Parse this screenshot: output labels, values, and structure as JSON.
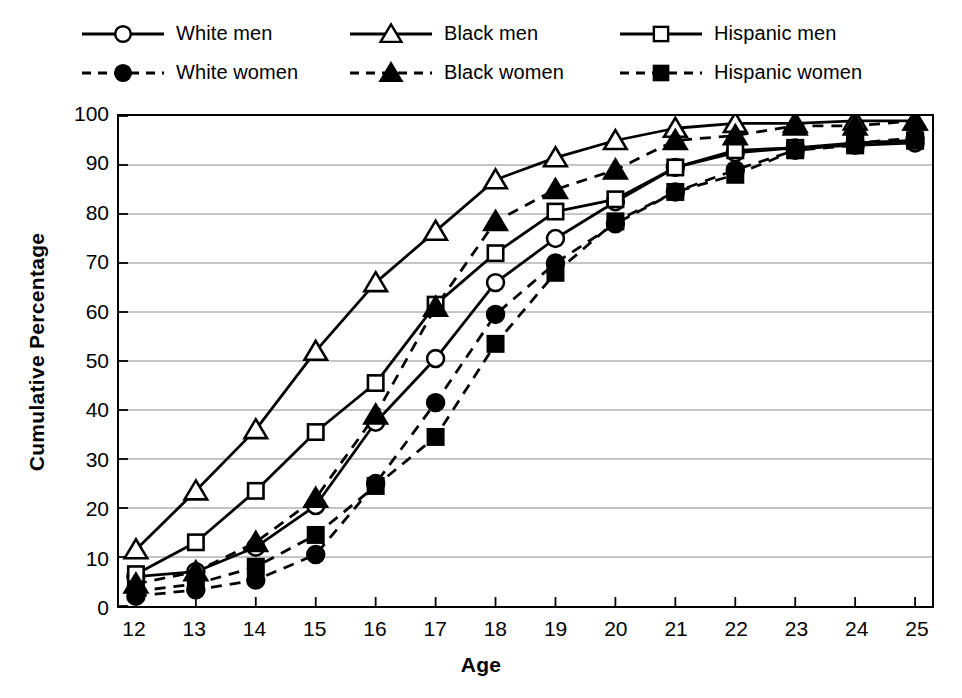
{
  "chart_data": {
    "type": "line",
    "title": "",
    "subtitle": "",
    "xlabel": "Age",
    "ylabel": "Cumulative Percentage",
    "x": [
      12,
      13,
      14,
      15,
      16,
      17,
      18,
      19,
      20,
      21,
      22,
      23,
      24,
      25
    ],
    "xlim": [
      12,
      25
    ],
    "ylim": [
      0,
      100
    ],
    "xticks": [
      "12",
      "13",
      "14",
      "15",
      "16",
      "17",
      "18",
      "19",
      "20",
      "21",
      "22",
      "23",
      "24",
      "25"
    ],
    "yticks": [
      "0",
      "10",
      "20",
      "30",
      "40",
      "50",
      "60",
      "70",
      "80",
      "90",
      "100"
    ],
    "grid": "horizontal",
    "legend_position": "top",
    "series": [
      {
        "name": "White men",
        "marker": "circle-open",
        "line": "solid",
        "color": "#000000",
        "values": [
          6.0,
          7.0,
          12.0,
          20.5,
          37.5,
          50.5,
          66.0,
          75.0,
          82.5,
          89.5,
          92.5,
          93.5,
          94.0,
          94.5
        ]
      },
      {
        "name": "Black men",
        "marker": "triangle-open",
        "line": "solid",
        "color": "#000000",
        "values": [
          11.5,
          23.5,
          36.0,
          52.0,
          66.0,
          76.5,
          87.0,
          91.5,
          95.0,
          97.5,
          98.5,
          98.5,
          99.0,
          99.0
        ]
      },
      {
        "name": "Hispanic men",
        "marker": "square-open",
        "line": "solid",
        "color": "#000000",
        "values": [
          6.5,
          13.0,
          23.5,
          35.5,
          45.5,
          61.5,
          72.0,
          80.5,
          83.0,
          89.5,
          93.0,
          93.5,
          94.5,
          95.0
        ]
      },
      {
        "name": "White women",
        "marker": "circle-filled",
        "line": "dashed",
        "color": "#000000",
        "values": [
          2.0,
          3.3,
          5.3,
          10.5,
          25.0,
          41.5,
          59.5,
          70.0,
          78.0,
          84.5,
          89.0,
          93.0,
          94.5,
          95.5
        ]
      },
      {
        "name": "Black women",
        "marker": "triangle-filled",
        "line": "dashed",
        "color": "#000000",
        "values": [
          4.5,
          7.0,
          13.0,
          22.0,
          39.0,
          61.0,
          78.5,
          85.0,
          89.0,
          95.0,
          96.0,
          98.0,
          98.0,
          99.0
        ]
      },
      {
        "name": "Hispanic women",
        "marker": "square-filled",
        "line": "dashed",
        "color": "#000000",
        "values": [
          3.0,
          4.5,
          8.0,
          14.5,
          24.5,
          34.5,
          53.5,
          68.0,
          78.5,
          84.5,
          88.0,
          93.0,
          94.0,
          95.0
        ]
      }
    ]
  },
  "legend": {
    "rows": [
      [
        {
          "label": "White men",
          "marker": "circle-open",
          "line": "solid"
        },
        {
          "label": "Black men",
          "marker": "triangle-open",
          "line": "solid"
        },
        {
          "label": "Hispanic men",
          "marker": "square-open",
          "line": "solid"
        }
      ],
      [
        {
          "label": "White women",
          "marker": "circle-filled",
          "line": "dashed"
        },
        {
          "label": "Black women",
          "marker": "triangle-filled",
          "line": "dashed"
        },
        {
          "label": "Hispanic women",
          "marker": "square-filled",
          "line": "dashed"
        }
      ]
    ]
  },
  "style": {
    "ink": "#000000",
    "grid_color": "#8c8c8c",
    "background": "#ffffff"
  }
}
